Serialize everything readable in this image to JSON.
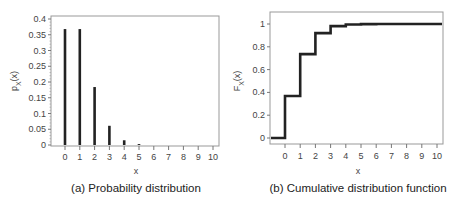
{
  "chart_data": [
    {
      "type": "bar",
      "subtype": "stem",
      "title": "",
      "caption": "(a) Probability distribution",
      "xlabel": "x",
      "ylabel": "p_X(x)",
      "ylabel_main": "p",
      "ylabel_sub": "X",
      "ylabel_suffix": "(x)",
      "categories": [
        "0",
        "1",
        "2",
        "3",
        "4",
        "5",
        "6",
        "7",
        "8",
        "9",
        "10"
      ],
      "values": [
        0.368,
        0.368,
        0.184,
        0.061,
        0.015,
        0.003,
        0.0005,
        0.0001,
        0.0,
        0.0,
        0.0
      ],
      "ylim": [
        0,
        0.4
      ],
      "yticks": [
        0,
        0.05,
        0.1,
        0.15,
        0.2,
        0.25,
        0.3,
        0.35,
        0.4
      ],
      "ytick_labels": [
        "0",
        "0.05",
        "0.1",
        "0.15",
        "0.2",
        "0.25",
        "0.3",
        "0.35",
        "0.4"
      ],
      "xticks": [
        "0",
        "1",
        "2",
        "3",
        "4",
        "5",
        "6",
        "7",
        "8",
        "9",
        "10"
      ],
      "grid": false,
      "legend": null
    },
    {
      "type": "line",
      "subtype": "step",
      "title": "",
      "caption": "(b) Cumulative distribution function",
      "xlabel": "x",
      "ylabel": "F_X(x)",
      "ylabel_main": "F",
      "ylabel_sub": "X",
      "ylabel_suffix": "(x)",
      "x": [
        0,
        1,
        2,
        3,
        4,
        5,
        6,
        7,
        8,
        9,
        10
      ],
      "values": [
        0.368,
        0.736,
        0.92,
        0.981,
        0.996,
        0.999,
        1.0,
        1.0,
        1.0,
        1.0,
        1.0
      ],
      "value_before_0": 0,
      "xlim": [
        -1,
        10.5
      ],
      "ylim": [
        -0.05,
        1.1
      ],
      "yticks": [
        0,
        0.2,
        0.4,
        0.6,
        0.8,
        1
      ],
      "ytick_labels": [
        "0",
        "0.2",
        "0.4",
        "0.6",
        "0.8",
        "1"
      ],
      "xticks": [
        "0",
        "1",
        "2",
        "3",
        "4",
        "5",
        "6",
        "7",
        "8",
        "9",
        "10"
      ],
      "grid": false,
      "legend": null
    }
  ],
  "colors": {
    "line": "#222222",
    "frame": "#888888",
    "text": "#444444"
  }
}
